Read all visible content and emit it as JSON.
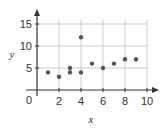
{
  "chart_data": {
    "type": "scatter",
    "title": "",
    "xlabel": "x",
    "ylabel": "y",
    "xlim": [
      0,
      10
    ],
    "ylim": [
      0,
      15
    ],
    "xticks": [
      2,
      4,
      6,
      8,
      10
    ],
    "yticks": [
      5,
      10,
      15
    ],
    "origin_label": "0",
    "grid": true,
    "legend": null,
    "points": [
      {
        "x": 1,
        "y": 4
      },
      {
        "x": 2,
        "y": 3
      },
      {
        "x": 3,
        "y": 5
      },
      {
        "x": 3,
        "y": 4
      },
      {
        "x": 4,
        "y": 12
      },
      {
        "x": 4,
        "y": 4
      },
      {
        "x": 5,
        "y": 6
      },
      {
        "x": 6,
        "y": 5
      },
      {
        "x": 7,
        "y": 6
      },
      {
        "x": 8,
        "y": 7
      },
      {
        "x": 9,
        "y": 7
      }
    ],
    "colors": {
      "point": "#555555",
      "axis": "#333333",
      "grid": "#cccccc"
    }
  }
}
